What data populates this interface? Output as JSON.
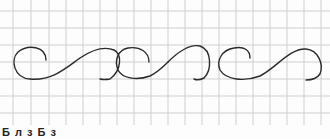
{
  "figure": {
    "grid": {
      "spacing_px": 17,
      "line_color": "#c8c8c8",
      "x_start": 13,
      "y_start": 10
    },
    "stroke_color": "#2a2a2a",
    "caption": "Б л з Б з"
  }
}
